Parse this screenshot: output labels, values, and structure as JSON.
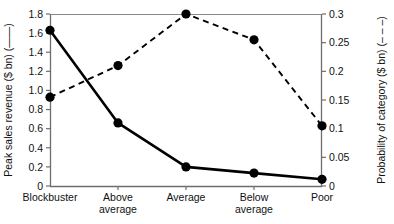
{
  "chart_data": {
    "type": "line",
    "title": "",
    "xlabel": "",
    "categories": [
      "Blockbuster",
      "Above average",
      "Average",
      "Below average",
      "Poor"
    ],
    "grid": false,
    "legend": "inline-in-axis-titles",
    "axes": {
      "left": {
        "label": "Peak sales revenue ($ bn) (——)",
        "ylim": [
          0,
          1.8
        ],
        "tick_step": 0.2,
        "ticks": [
          "0",
          "0.2",
          "0.4",
          "0.6",
          "0.8",
          "1.0",
          "1.2",
          "1.4",
          "1.6",
          "1.8"
        ],
        "tick_values": [
          0,
          0.2,
          0.4,
          0.6,
          0.8,
          1.0,
          1.2,
          1.4,
          1.6,
          1.8
        ]
      },
      "right": {
        "label": "Probability of category ($ bn) (– – –)",
        "ylim": [
          0,
          0.3
        ],
        "tick_step": 0.05,
        "ticks": [
          "0",
          "0.05",
          "0.1",
          "0.15",
          "0.2",
          "0.25",
          "0.3"
        ],
        "tick_values": [
          0,
          0.05,
          0.1,
          0.15,
          0.2,
          0.25,
          0.3
        ]
      }
    },
    "series": [
      {
        "name": "Peak sales revenue ($ bn)",
        "style": "solid",
        "axis": "left",
        "marker": "filled-circle",
        "values": [
          1.63,
          0.66,
          0.2,
          0.135,
          0.07
        ]
      },
      {
        "name": "Probability of category",
        "style": "dashed",
        "axis": "right",
        "marker": "filled-circle",
        "values": [
          0.155,
          0.21,
          0.3,
          0.255,
          0.105
        ]
      }
    ],
    "colors": {
      "series": "#000000",
      "axis": "#6e6e6e",
      "frame": "#8a8a8a",
      "background": "#ffffff"
    }
  }
}
